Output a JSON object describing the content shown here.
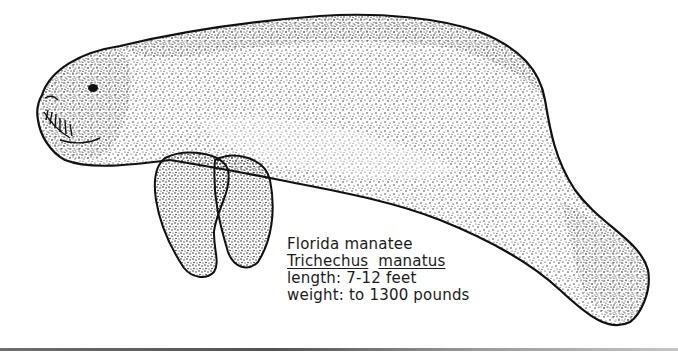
{
  "illustration": {
    "subject": "manatee",
    "style": "stipple ink drawing",
    "colors": {
      "ink": "#111111",
      "background": "#ffffff"
    }
  },
  "caption": {
    "common_name": "Florida manatee",
    "genus": "Trichechus",
    "species": "manatus",
    "length_label": "length:",
    "length_value": "7-12 feet",
    "weight_label": "weight:",
    "weight_value": "to 1300 pounds"
  }
}
